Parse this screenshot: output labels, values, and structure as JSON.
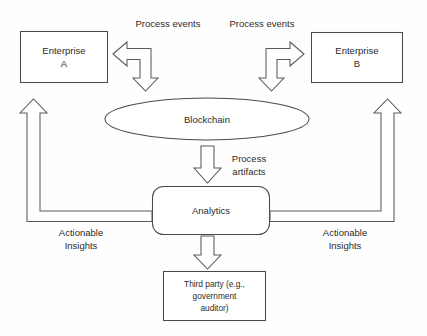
{
  "diagram": {
    "background_color": "#fefefe",
    "stroke_color": "#4a4a4a",
    "text_color": "#2b2b2b",
    "nodes": {
      "enterprise_a": {
        "line1": "Enterprise",
        "line2": "A",
        "shape": "rectangle"
      },
      "enterprise_b": {
        "line1": "Enterprise",
        "line2": "B",
        "shape": "rectangle"
      },
      "blockchain": {
        "label": "Blockchain",
        "shape": "ellipse"
      },
      "analytics": {
        "label": "Analytics",
        "shape": "rounded-rectangle"
      },
      "third_party": {
        "line1": "Third party (e.g.,",
        "line2": "government",
        "line3": "auditor)",
        "shape": "rectangle"
      }
    },
    "edges": {
      "process_events_left": {
        "label": "Process events",
        "arrow": "bent-double-arrow-left-down"
      },
      "process_events_right": {
        "label": "Process events",
        "arrow": "bent-double-arrow-right-down"
      },
      "process_artifacts": {
        "line1": "Process",
        "line2": "artifacts",
        "arrow": "down-block-arrow"
      },
      "actionable_insights_left": {
        "line1": "Actionable",
        "line2": "Insights",
        "arrow": "elbow-up-arrow"
      },
      "actionable_insights_right": {
        "line1": "Actionable",
        "line2": "Insights",
        "arrow": "elbow-up-arrow"
      },
      "analytics_to_third_party": {
        "arrow": "down-block-arrow"
      }
    }
  }
}
